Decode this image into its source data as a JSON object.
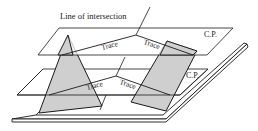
{
  "diagram": {
    "type": "cutting-plane traces illustration",
    "labels": {
      "line_of_intersection": "Line of intersection",
      "upper_plane": "C.P.",
      "lower_plane": "C.P.",
      "trace_upper_left": "Trace",
      "trace_upper_right": "Trace",
      "trace_lower_left": "Trace",
      "trace_lower_right": "Trace"
    },
    "colors": {
      "stroke": "#1a1a1a",
      "shaded_fill": "#cfcfcf",
      "background": "#ffffff"
    }
  }
}
